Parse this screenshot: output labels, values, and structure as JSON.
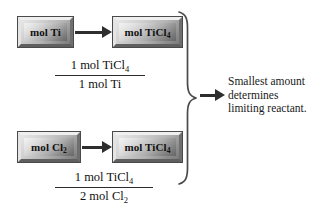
{
  "figure": {
    "background_color": "#ffffff",
    "ink_color": "#1a1a1a",
    "arrow_color": "#2e2e2e"
  },
  "rows": [
    {
      "id": "row-titanium",
      "start_box": {
        "label": "mol Ti",
        "formula_base": "mol Ti",
        "subscript": ""
      },
      "end_box": {
        "label": "mol TiCl",
        "formula_base": "mol TiCl",
        "subscript": "4"
      },
      "arrow": {
        "name": "conversion-arrow",
        "direction": "right"
      },
      "conversion_factor": {
        "numerator_base": "1 mol TiCl",
        "numerator_subscript": "4",
        "denominator_base": "1 mol Ti",
        "denominator_subscript": ""
      }
    },
    {
      "id": "row-chlorine",
      "start_box": {
        "label": "mol Cl",
        "formula_base": "mol Cl",
        "subscript": "2"
      },
      "end_box": {
        "label": "mol TiCl",
        "formula_base": "mol TiCl",
        "subscript": "4"
      },
      "arrow": {
        "name": "conversion-arrow",
        "direction": "right"
      },
      "conversion_factor": {
        "numerator_base": "1 mol TiCl",
        "numerator_subscript": "4",
        "denominator_base": "2 mol Cl",
        "denominator_subscript": "2"
      }
    }
  ],
  "brace": {
    "name": "right-curly-brace",
    "orientation": "right-pointing",
    "color": "#4a4a4a"
  },
  "result_arrow": {
    "name": "result-arrow",
    "direction": "right"
  },
  "caption": {
    "line1": "Smallest amount",
    "line2": "determines",
    "line3": "limiting reactant."
  }
}
